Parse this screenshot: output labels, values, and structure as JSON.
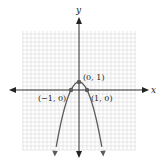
{
  "chart_data": {
    "type": "line",
    "title": "",
    "xlabel": "x",
    "ylabel": "y",
    "function": "y = 1 - x^2",
    "xlim": [
      -7,
      7
    ],
    "ylim": [
      -8,
      7.5
    ],
    "grid": true,
    "grid_step": 0.5,
    "series": [
      {
        "name": "parabola",
        "x": [
          -3,
          -2.5,
          -2,
          -1.5,
          -1,
          -0.5,
          0,
          0.5,
          1,
          1.5,
          2,
          2.5,
          3
        ],
        "y": [
          -8,
          -5.25,
          -3,
          -1.25,
          0,
          0.75,
          1,
          0.75,
          0,
          -1.25,
          -3,
          -5.25,
          -8
        ]
      }
    ],
    "points": [
      {
        "x": 0,
        "y": 1,
        "label": "(0, 1)"
      },
      {
        "x": -1,
        "y": 0,
        "label": "(−1, 0)"
      },
      {
        "x": 1,
        "y": 0,
        "label": "(1, 0)"
      }
    ],
    "annotations": [
      "(0, 1)",
      "(−1, 0)",
      "(1, 0)"
    ]
  },
  "labels": {
    "x_axis": "x",
    "y_axis": "y",
    "vertex": "(0, 1)",
    "left_root": "(−1, 0)",
    "right_root": "(1, 0)"
  },
  "colors": {
    "curve": "#5a5a5a",
    "axis": "#333333",
    "grid": "#d9d9d9",
    "point": "#5a5a5a"
  }
}
